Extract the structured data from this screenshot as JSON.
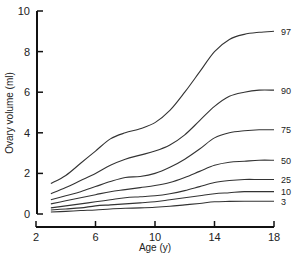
{
  "chart_data": {
    "type": "line",
    "title": "",
    "xlabel": "Age (y)",
    "ylabel": "Ovary volume (ml)",
    "xlim": [
      2,
      18
    ],
    "ylim": [
      0,
      10
    ],
    "x_ticks": [
      2,
      6,
      10,
      14,
      18
    ],
    "y_ticks": [
      0,
      2,
      4,
      6,
      8,
      10
    ],
    "grid": false,
    "legend_position": "inline-right",
    "x": [
      3,
      4,
      5,
      6,
      7,
      8,
      9,
      10,
      11,
      12,
      13,
      14,
      15,
      16,
      17,
      18
    ],
    "series": [
      {
        "name": "97",
        "values": [
          1.5,
          1.9,
          2.5,
          3.1,
          3.7,
          4.0,
          4.2,
          4.5,
          5.1,
          6.0,
          7.0,
          8.0,
          8.6,
          8.85,
          8.95,
          9.0
        ]
      },
      {
        "name": "90",
        "values": [
          1.0,
          1.3,
          1.65,
          2.0,
          2.4,
          2.7,
          2.9,
          3.1,
          3.4,
          3.9,
          4.6,
          5.3,
          5.8,
          6.0,
          6.1,
          6.1
        ]
      },
      {
        "name": "75",
        "values": [
          0.7,
          0.9,
          1.1,
          1.35,
          1.6,
          1.8,
          1.85,
          2.0,
          2.3,
          2.7,
          3.2,
          3.75,
          4.0,
          4.1,
          4.15,
          4.15
        ]
      },
      {
        "name": "50",
        "values": [
          0.5,
          0.65,
          0.8,
          0.95,
          1.1,
          1.2,
          1.3,
          1.4,
          1.55,
          1.8,
          2.1,
          2.4,
          2.55,
          2.6,
          2.65,
          2.65
        ]
      },
      {
        "name": "25",
        "values": [
          0.3,
          0.4,
          0.5,
          0.6,
          0.7,
          0.8,
          0.85,
          0.9,
          1.0,
          1.15,
          1.35,
          1.55,
          1.65,
          1.7,
          1.7,
          1.7
        ]
      },
      {
        "name": "10",
        "values": [
          0.2,
          0.25,
          0.3,
          0.4,
          0.45,
          0.5,
          0.55,
          0.6,
          0.7,
          0.8,
          0.9,
          1.0,
          1.05,
          1.1,
          1.1,
          1.1
        ]
      },
      {
        "name": "3",
        "values": [
          0.1,
          0.13,
          0.17,
          0.2,
          0.25,
          0.28,
          0.3,
          0.33,
          0.38,
          0.45,
          0.52,
          0.6,
          0.62,
          0.63,
          0.63,
          0.63
        ]
      }
    ]
  },
  "labels": {
    "xlabel": "Age (y)",
    "ylabel": "Ovary volume (ml)"
  },
  "style": {
    "line_color": "#333333",
    "axis_color": "#111111"
  }
}
